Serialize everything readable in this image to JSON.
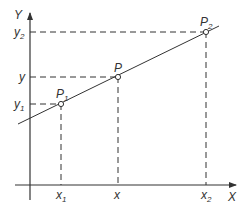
{
  "diagram": {
    "title": "",
    "axes": {
      "x_label": "X",
      "y_label": "Y"
    },
    "points": [
      {
        "name": "P",
        "sub": "1",
        "x_label": "x",
        "x_sub": "1",
        "y_label": "y",
        "y_sub": "1"
      },
      {
        "name": "P",
        "sub": "",
        "x_label": "x",
        "x_sub": "",
        "y_label": "y",
        "y_sub": ""
      },
      {
        "name": "P",
        "sub": "2",
        "x_label": "x",
        "x_sub": "2",
        "y_label": "y",
        "y_sub": "2"
      }
    ],
    "colors": {
      "line": "#333333",
      "background": "#ffffff"
    }
  }
}
